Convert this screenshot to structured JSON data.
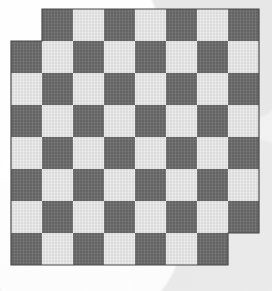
{
  "chart_data": {
    "type": "heatmap",
    "subtitle": "",
    "xlabel": "",
    "ylabel": "",
    "rows": 8,
    "cols": 8,
    "cell_width": 31,
    "cell_height": 32,
    "origin_x": 11,
    "origin_y": 9,
    "legend_position": "none",
    "grid": false,
    "categories": [
      "a",
      "b",
      "c",
      "d",
      "e",
      "f",
      "g",
      "h"
    ],
    "row_labels": [
      "8",
      "7",
      "6",
      "5",
      "4",
      "3",
      "2",
      "1"
    ],
    "colors": {
      "dark": "#6b6b6b",
      "light": "#ececec",
      "background": "#f1f1f1",
      "outline": "#4a4a4a"
    },
    "omitted_cells": [
      {
        "row": 0,
        "col": 0
      },
      {
        "row": 7,
        "col": 7
      }
    ],
    "values": [
      [
        null,
        1,
        0,
        1,
        0,
        1,
        0,
        1
      ],
      [
        1,
        0,
        1,
        0,
        1,
        0,
        1,
        0
      ],
      [
        0,
        1,
        0,
        1,
        0,
        1,
        0,
        1
      ],
      [
        1,
        0,
        1,
        0,
        1,
        0,
        1,
        0
      ],
      [
        0,
        1,
        0,
        1,
        0,
        1,
        0,
        1
      ],
      [
        1,
        0,
        1,
        0,
        1,
        0,
        1,
        0
      ],
      [
        0,
        1,
        0,
        1,
        0,
        1,
        0,
        1
      ],
      [
        1,
        0,
        1,
        0,
        1,
        0,
        1,
        null
      ]
    ],
    "value_labels": {
      "0": "light",
      "1": "dark"
    }
  }
}
